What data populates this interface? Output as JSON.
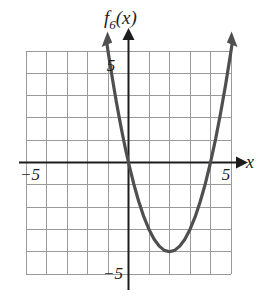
{
  "figure": {
    "kind": "coordinate-plane-graph",
    "background_color": "#ffffff",
    "grid_color": "#9a9a9a",
    "axis_color": "#1d1d1d",
    "curve_color": "#4f4f4f"
  },
  "labels": {
    "function_name": "f",
    "function_subscript": "6",
    "function_argument": "(x)",
    "function_full": "f6(x)",
    "x_axis": "x",
    "x_tick_negative": "−5",
    "x_tick_positive": "5",
    "y_tick_positive": "5",
    "y_tick_negative": "−5"
  },
  "chart_data": {
    "type": "line",
    "title": "",
    "subtitle": "",
    "xlabel": "x",
    "ylabel": "f6(x)",
    "xlim": [
      -5,
      5
    ],
    "ylim": [
      -5,
      5
    ],
    "grid": true,
    "grid_step": 1,
    "legend": "none",
    "xticks": [
      -5,
      5
    ],
    "yticks": [
      -5,
      5
    ],
    "xtick_labels": [
      "−5",
      "5"
    ],
    "ytick_labels": [
      "−5",
      "5"
    ],
    "annotations": [
      {
        "text": "f6(x)",
        "x": -0.3,
        "y": 5.9,
        "role": "curve-label"
      },
      {
        "text": "x",
        "x": 5.8,
        "y": 0.35,
        "role": "axis-label"
      }
    ],
    "series": [
      {
        "name": "f6(x)",
        "equation": "f(x) = x^2 - 4x",
        "vertex": [
          2,
          -4
        ],
        "roots": [
          0,
          4
        ],
        "y_intercept": 0,
        "opens": "up",
        "arrowheads": [
          "start",
          "end"
        ],
        "x": [
          -1.05,
          -0.9,
          -0.75,
          -0.6,
          -0.45,
          -0.3,
          -0.15,
          0,
          0.25,
          0.5,
          0.75,
          1,
          1.25,
          1.5,
          1.75,
          2,
          2.25,
          2.5,
          2.75,
          3,
          3.25,
          3.5,
          3.75,
          4,
          4.25,
          4.5,
          4.75,
          5,
          5.05
        ],
        "y": [
          5.3,
          4.41,
          3.56,
          2.76,
          2.0,
          1.29,
          0.62,
          0,
          -0.94,
          -1.75,
          -2.44,
          -3,
          -3.44,
          -3.75,
          -3.94,
          -4,
          -3.94,
          -3.75,
          -3.44,
          -3,
          -2.44,
          -1.75,
          -0.94,
          0,
          1.06,
          2.25,
          3.56,
          5,
          5.3
        ]
      }
    ]
  }
}
